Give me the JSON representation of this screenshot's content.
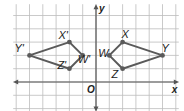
{
  "diagram": {
    "type": "coordinate-plane-reflection",
    "grid": {
      "xmin": -6,
      "xmax": 6,
      "ymin": -2,
      "ymax": 6,
      "origin_px": [
        96,
        82
      ],
      "unit_px": 13.3,
      "color": "#bdbdbd"
    },
    "axes": {
      "x_label": "x",
      "y_label": "y",
      "origin_label": "O",
      "color": "#555555"
    },
    "polygon_color": "#5a5a5a",
    "figures": [
      {
        "name": "WXYZ",
        "vertices": [
          {
            "label": "W",
            "x": 1,
            "y": 2
          },
          {
            "label": "X",
            "x": 2,
            "y": 3
          },
          {
            "label": "Y",
            "x": 5,
            "y": 2
          },
          {
            "label": "Z",
            "x": 2,
            "y": 1
          }
        ]
      },
      {
        "name": "W'X'Y'Z'",
        "vertices": [
          {
            "label": "W'",
            "x": -1,
            "y": 2
          },
          {
            "label": "X'",
            "x": -2,
            "y": 3
          },
          {
            "label": "Y'",
            "x": -5,
            "y": 2
          },
          {
            "label": "Z'",
            "x": -2,
            "y": 1
          }
        ]
      }
    ]
  }
}
